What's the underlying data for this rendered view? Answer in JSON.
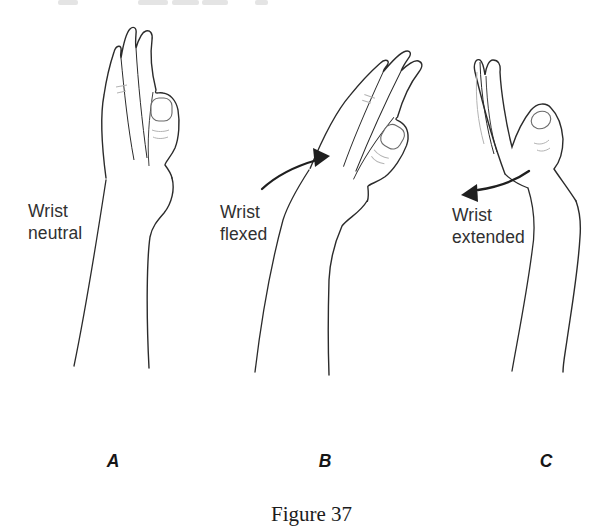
{
  "figure": {
    "caption": "Figure 37",
    "panels": [
      {
        "letter": "A",
        "label": "Wrist\nneutral",
        "illustration": "hand-side-view-wrist-neutral"
      },
      {
        "letter": "B",
        "label": "Wrist\nflexed",
        "illustration": "hand-side-view-wrist-flexed",
        "arrow_icon": "curved-arrow-right-icon"
      },
      {
        "letter": "C",
        "label": "Wrist\nextended",
        "illustration": "hand-side-view-wrist-extended-thumb-open",
        "arrow_icon": "curved-arrow-left-icon"
      }
    ],
    "colors": {
      "outline": "#2b2b2b",
      "light_detail": "#b3b3b3",
      "nail_line": "#6a6a6a",
      "arrow": "#1f1f1f",
      "label_text": "#303030",
      "caption_text": "#1c1c1c",
      "background": "#ffffff"
    }
  }
}
